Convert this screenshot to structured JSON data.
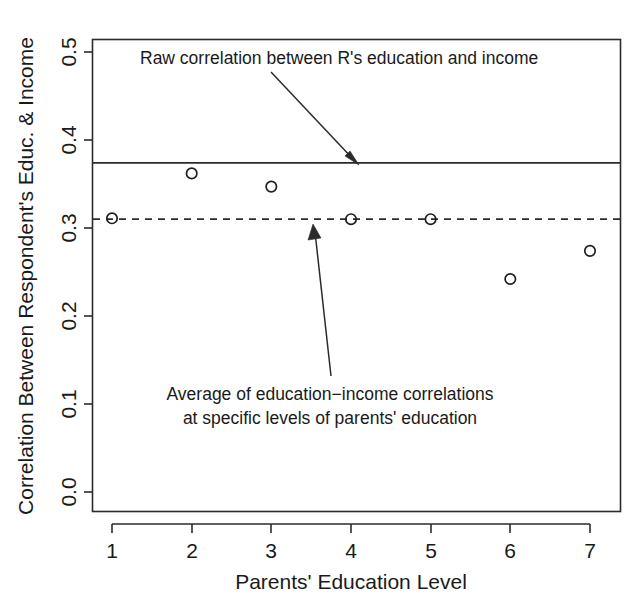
{
  "chart_data": {
    "type": "scatter",
    "title": "",
    "xlabel": "Parents' Education Level",
    "ylabel": "Correlation Between Respondent's Educ. & Income",
    "xlim": [
      0.6,
      7.4
    ],
    "ylim": [
      -0.02,
      0.53
    ],
    "grid": false,
    "legend_position": "none",
    "x": [
      1,
      2,
      3,
      4,
      5,
      6,
      7
    ],
    "categories": [
      "1",
      "2",
      "3",
      "4",
      "5",
      "6",
      "7"
    ],
    "values": [
      0.311,
      0.362,
      0.347,
      0.31,
      0.31,
      0.242,
      0.274
    ],
    "series": [
      {
        "name": "Education-income correlation at parents' education level",
        "values": [
          0.311,
          0.362,
          0.347,
          0.31,
          0.31,
          0.242,
          0.274
        ]
      }
    ],
    "xticks": [
      1,
      2,
      3,
      4,
      5,
      6,
      7
    ],
    "xticklabels": [
      "1",
      "2",
      "3",
      "4",
      "5",
      "6",
      "7"
    ],
    "yticks": [
      0.0,
      0.1,
      0.2,
      0.3,
      0.4,
      0.5
    ],
    "yticklabels": [
      "0.0",
      "0.1",
      "0.2",
      "0.3",
      "0.4",
      "0.5"
    ],
    "reference_lines": [
      {
        "name": "raw-correlation",
        "style": "solid",
        "value": 0.374,
        "label": "Raw correlation between R's education and income"
      },
      {
        "name": "average-correlation",
        "style": "dashed",
        "value": 0.31,
        "label": "Average of education-income correlations at specific levels of parents' education"
      }
    ],
    "annotations": [
      {
        "name": "raw-correlation-annotation",
        "text": "Raw correlation between R's education and income",
        "points_to": 0.374
      },
      {
        "name": "average-correlation-annotation",
        "line1": "Average of education−income correlations",
        "line2": "at specific levels of parents' education",
        "points_to": 0.31
      }
    ],
    "colors": {
      "foreground": "#2b2b2b",
      "background": "#ffffff",
      "marker": "#1f1f1f"
    }
  },
  "axes": {
    "y_title": "Correlation Between Respondent's Educ. & Income",
    "x_title": "Parents' Education Level",
    "y_tick_labels": [
      "0.0",
      "0.1",
      "0.2",
      "0.3",
      "0.4",
      "0.5"
    ],
    "x_tick_labels": [
      "1",
      "2",
      "3",
      "4",
      "5",
      "6",
      "7"
    ]
  },
  "annotations": {
    "top": "Raw correlation between R's education and income",
    "bottom_line1": "Average of education−income correlations",
    "bottom_line2": "at specific levels of parents' education"
  }
}
